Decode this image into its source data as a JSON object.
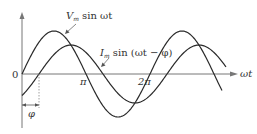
{
  "diagram": {
    "type": "phase_lag_waveforms",
    "origin_label": "0",
    "x_axis_label": "ωt",
    "tick_labels": [
      "π",
      "2π"
    ],
    "phase_label": "φ",
    "curves": [
      {
        "name": "voltage",
        "label_main": "V",
        "label_sub": "m",
        "label_rest": " sin ωt",
        "amplitude_px": 43,
        "phase_px": 0
      },
      {
        "name": "current",
        "label_main": "I",
        "label_sub": "m",
        "label_rest": " sin (ωt − φ)",
        "amplitude_px": 29,
        "phase_px": 17
      }
    ],
    "colors": {
      "line": "#2a2a2a",
      "axis": "#777777",
      "text": "#333333"
    }
  },
  "chart_data": {
    "type": "line",
    "title": "",
    "xlabel": "ωt",
    "ylabel": "",
    "x_ticks": [
      "0",
      "π",
      "2π"
    ],
    "series": [
      {
        "name": "V_m sin ωt",
        "amplitude": 1.0,
        "phase": 0
      },
      {
        "name": "I_m sin (ωt − φ)",
        "amplitude": 0.67,
        "phase": "φ ≈ 0.83 rad"
      }
    ],
    "x_range": [
      "0",
      "≈3.5π"
    ],
    "grid": false
  }
}
